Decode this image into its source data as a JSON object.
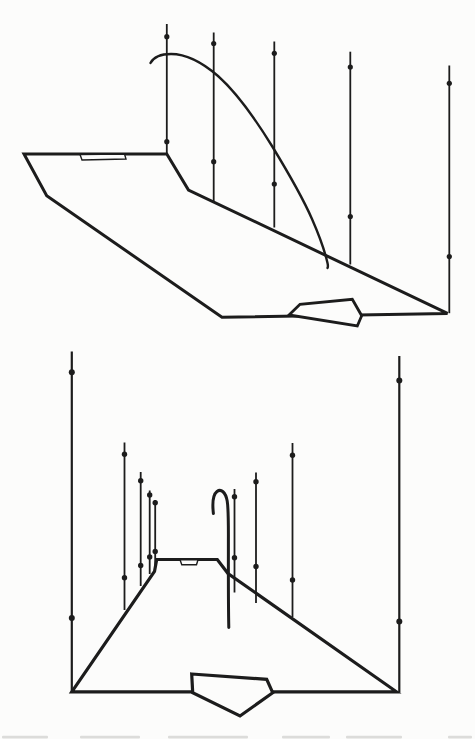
{
  "page": {
    "width": 475,
    "height": 739,
    "background": "#fcfcfb",
    "ink": "#1c1c1c"
  },
  "figures": [
    {
      "id": "oblique-view",
      "description": "oblique perspective view of road surface with measurement poles and ballistic trajectory arc",
      "layers": [
        {
          "kind": "polygon",
          "name": "road-surface",
          "points": [
            [
              24,
              154
            ],
            [
              166.8,
              154
            ],
            [
              188.5,
              190
            ],
            [
              447.5,
              313.4
            ],
            [
              222,
              317.3
            ],
            [
              46.7,
              195.7
            ]
          ],
          "w": 3,
          "fill": true
        },
        {
          "kind": "polygon",
          "name": "road-marking",
          "points": [
            [
              80,
              154.5
            ],
            [
              124.5,
              154
            ],
            [
              126,
              159
            ],
            [
              82,
              160
            ]
          ],
          "w": 1.4,
          "fill": true
        },
        {
          "kind": "polygon",
          "name": "direction-pentagon",
          "points": [
            [
              289,
              315
            ],
            [
              300,
              304.3
            ],
            [
              352.3,
              299.3
            ],
            [
              361.7,
              315.7
            ],
            [
              357.3,
              326
            ]
          ],
          "w": 2.8,
          "fill": true
        },
        {
          "kind": "poles",
          "name": "measurement-poles",
          "w": 1.8,
          "r": 2.6,
          "items": [
            {
              "x": 166.8,
              "y1": 24,
              "y2": 154,
              "dots": [
                36.7,
                141.7
              ]
            },
            {
              "x": 213.7,
              "y1": 32.5,
              "y2": 201.5,
              "dots": [
                43.5,
                161.7
              ]
            },
            {
              "x": 274.3,
              "y1": 41.5,
              "y2": 227.5,
              "dots": [
                53.3,
                184
              ]
            },
            {
              "x": 350.3,
              "y1": 51.7,
              "y2": 264.5,
              "dots": [
                67,
                216.5
              ]
            },
            {
              "x": 449.3,
              "y1": 65.5,
              "y2": 313.2,
              "dots": [
                83.3,
                256.6
              ]
            }
          ]
        },
        {
          "kind": "path",
          "name": "trajectory-arc",
          "w": 2.4,
          "d": "M 150.5 63 C 153.5 57.5 161 54 171 54 C 186 54 203 63 218 76 C 237 93 256 120 272 146 C 286 169 302 196 312 219 C 319 235 325 252 327.5 263 C 328.1 265.5 328.3 266.5 327.5 268"
        }
      ]
    },
    {
      "id": "rear-view",
      "description": "rear perspective view of road with tall boundary poles, pole clusters and hooked falling trajectory",
      "layers": [
        {
          "kind": "polygon",
          "name": "road-surface",
          "points": [
            [
              156.7,
              559.5
            ],
            [
              217.3,
              559.5
            ],
            [
              228,
              573.5
            ],
            [
              396.5,
              691.8
            ],
            [
              71.8,
              691.8
            ],
            [
              154.5,
              571.5
            ]
          ],
          "w": 3.2,
          "fill": true
        },
        {
          "kind": "polygon",
          "name": "road-marking",
          "points": [
            [
              180,
              559.8
            ],
            [
              198,
              559.8
            ],
            [
              196.5,
              564.8
            ],
            [
              181.8,
              564.8
            ]
          ],
          "w": 1.4,
          "fill": true
        },
        {
          "kind": "polygon",
          "name": "direction-pentagon",
          "points": [
            [
              191.7,
              674
            ],
            [
              266.7,
              679.3
            ],
            [
              272.7,
              692.7
            ],
            [
              240,
              716
            ],
            [
              192.7,
              692.7
            ]
          ],
          "w": 3.2,
          "fill": true
        },
        {
          "kind": "poles",
          "name": "boundary-poles",
          "w": 2.2,
          "r": 3,
          "items": [
            {
              "x": 71.8,
              "y1": 351.5,
              "y2": 692,
              "dots": [
                372.3,
                618
              ]
            },
            {
              "x": 399.3,
              "y1": 356,
              "y2": 692.5,
              "dots": [
                380.5,
                621.5
              ]
            }
          ]
        },
        {
          "kind": "poles",
          "name": "measurement-poles",
          "w": 1.8,
          "r": 2.7,
          "items": [
            {
              "x": 124.5,
              "y1": 442.5,
              "y2": 610,
              "dots": [
                454.3,
                577.8
              ]
            },
            {
              "x": 140.7,
              "y1": 472,
              "y2": 586,
              "dots": [
                480.7,
                565.5
              ]
            },
            {
              "x": 149.7,
              "y1": 490.5,
              "y2": 574,
              "dots": [
                495,
                557
              ]
            },
            {
              "x": 155.2,
              "y1": 500,
              "y2": 566.5,
              "dots": [
                502.8,
                551.5
              ]
            },
            {
              "x": 234.5,
              "y1": 489,
              "y2": 592.5,
              "dots": [
                496.7,
                557.7
              ]
            },
            {
              "x": 256,
              "y1": 472.5,
              "y2": 603,
              "dots": [
                481.7,
                566.5
              ]
            },
            {
              "x": 292.5,
              "y1": 443,
              "y2": 617,
              "dots": [
                455.3,
                580
              ]
            }
          ]
        },
        {
          "kind": "path",
          "name": "hook-trajectory",
          "w": 3,
          "d": "M 213.4 513.5 C 212.2 503 213.2 494.5 217 491.5 C 221 488.5 225.6 492 227.2 501 C 228.2 507 228.4 518 228.4 535 C 228.4 570 228.2 600 228.8 627.5"
        }
      ]
    }
  ],
  "caption_remnant": {
    "color": "#dcdcda",
    "y": 735.8,
    "segments": [
      [
        2,
        46
      ],
      [
        80,
        60
      ],
      [
        168,
        80
      ],
      [
        282,
        48
      ],
      [
        346,
        56
      ],
      [
        448,
        24
      ]
    ]
  }
}
